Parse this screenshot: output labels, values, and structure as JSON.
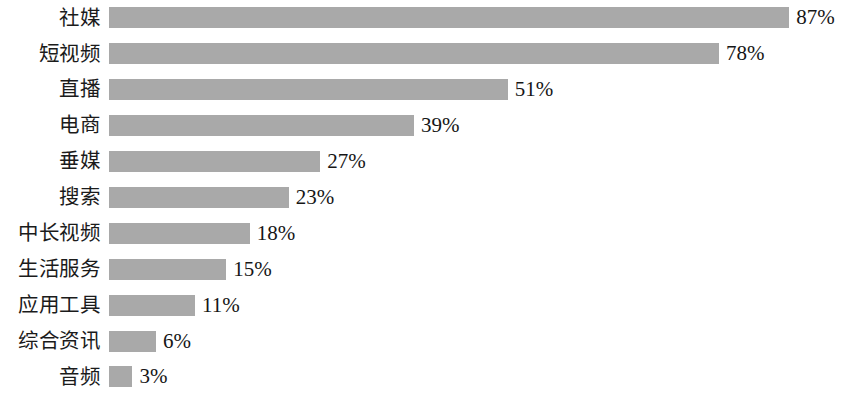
{
  "chart_data": {
    "type": "bar",
    "orientation": "horizontal",
    "title": "",
    "subtitle": "",
    "xlabel": "",
    "ylabel": "",
    "xlim": [
      0,
      100
    ],
    "grid": false,
    "legend": null,
    "value_suffix": "%",
    "bar_color": "#a9a9a9",
    "background_color": "#ffffff",
    "text_color": "#1b1b1b",
    "categories": [
      "社媒",
      "短视频",
      "直播",
      "电商",
      "垂媒",
      "搜索",
      "中长视频",
      "生活服务",
      "应用工具",
      "综合资讯",
      "音频"
    ],
    "values": [
      87,
      78,
      51,
      39,
      27,
      23,
      18,
      15,
      11,
      6,
      3
    ],
    "value_labels": [
      "87%",
      "78%",
      "51%",
      "39%",
      "27%",
      "23%",
      "18%",
      "15%",
      "11%",
      "6%",
      "3%"
    ],
    "rows": [
      {
        "label": "社媒",
        "value": 87,
        "value_label": "87%"
      },
      {
        "label": "短视频",
        "value": 78,
        "value_label": "78%"
      },
      {
        "label": "直播",
        "value": 51,
        "value_label": "51%"
      },
      {
        "label": "电商",
        "value": 39,
        "value_label": "39%"
      },
      {
        "label": "垂媒",
        "value": 27,
        "value_label": "27%"
      },
      {
        "label": "搜索",
        "value": 23,
        "value_label": "23%"
      },
      {
        "label": "中长视频",
        "value": 18,
        "value_label": "18%"
      },
      {
        "label": "生活服务",
        "value": 15,
        "value_label": "15%"
      },
      {
        "label": "应用工具",
        "value": 11,
        "value_label": "11%"
      },
      {
        "label": "综合资讯",
        "value": 6,
        "value_label": "6%"
      },
      {
        "label": "音频",
        "value": 3,
        "value_label": "3%"
      }
    ]
  },
  "layout": {
    "bar_origin_x": 109,
    "px_per_unit": 7.82,
    "row_height": 35.9,
    "first_row_top": 0,
    "bar_thickness": 21,
    "label_column_width": 100
  }
}
